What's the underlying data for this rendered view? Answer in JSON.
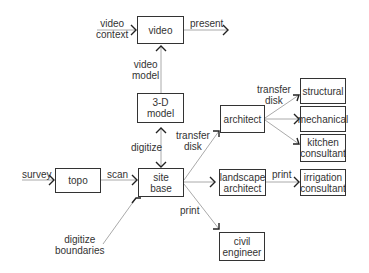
{
  "diagram": {
    "nodes": {
      "video": "video",
      "model3d_line1": "3-D",
      "model3d_line2": "model",
      "topo": "topo",
      "site_base_line1": "site",
      "site_base_line2": "base",
      "architect": "architect",
      "landscape_line1": "landscape",
      "landscape_line2": "architect",
      "civil_line1": "civil",
      "civil_line2": "engineer",
      "structural": "structural",
      "mechanical": "mechanical",
      "kitchen_line1": "kitchen",
      "kitchen_line2": "consultant",
      "irrigation_line1": "irrigation",
      "irrigation_line2": "consultant"
    },
    "edges": {
      "video_context_line1": "video",
      "video_context_line2": "context",
      "present": "present",
      "video_model_line1": "video",
      "video_model_line2": "model",
      "digitize": "digitize",
      "survey": "survey",
      "scan": "scan",
      "digitize_boundaries_line1": "digitize",
      "digitize_boundaries_line2": "boundaries",
      "transfer_disk_arch_line1": "transfer",
      "transfer_disk_arch_line2": "disk",
      "transfer_disk_cons_line1": "transfer",
      "transfer_disk_cons_line2": "disk",
      "print_civil": "print",
      "print_irrigation": "print"
    }
  }
}
